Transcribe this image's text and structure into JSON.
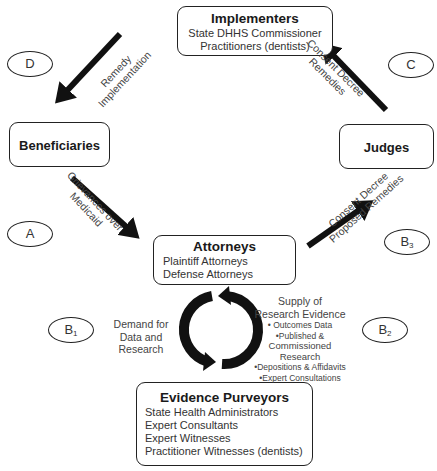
{
  "nodes": {
    "implementers": {
      "title": "Implementers",
      "lines": [
        "State DHHS Commissioner",
        "Practitioners (dentists)"
      ]
    },
    "beneficiaries": {
      "title": "Beneficiaries"
    },
    "judges": {
      "title": "Judges"
    },
    "attorneys": {
      "title": "Attorneys",
      "lines": [
        "Plaintiff Attorneys",
        "Defense Attorneys"
      ]
    },
    "evidence_purveyors": {
      "title": "Evidence Purveyors",
      "lines": [
        "State Health Administrators",
        "Expert Consultants",
        "Expert Witnesses",
        "Practitioner Witnesses (dentists)"
      ]
    }
  },
  "phases": {
    "A": {
      "label": "A"
    },
    "B1": {
      "label": "B",
      "sub": "1"
    },
    "B2": {
      "label": "B",
      "sub": "2"
    },
    "B3": {
      "label": "B",
      "sub": "3"
    },
    "C": {
      "label": "C"
    },
    "D": {
      "label": "D"
    }
  },
  "edges": {
    "remedy_implementation": {
      "line1": "Remedy",
      "line2": "Implementation"
    },
    "consent_decree_remedies": {
      "line1": "Consent Decree",
      "line2": "Remedies"
    },
    "grievances": {
      "line1": "Grievances over",
      "line2": "Medicaid"
    },
    "proposed_remedies": {
      "line1": "Consent Decree",
      "line2": "Proposed Remedies"
    }
  },
  "cycle": {
    "demand": {
      "lines": [
        "Demand for",
        "Data and",
        "Research"
      ]
    },
    "supply": {
      "lines": [
        "Supply of",
        "Research Evidence",
        "• Outcomes Data",
        "•Published &",
        "Commissioned Research",
        "•Depositions & Affidavits",
        "•Expert Consultations"
      ]
    }
  },
  "colors": {
    "stroke": "#111111",
    "text": "#333333",
    "background": "#ffffff"
  }
}
